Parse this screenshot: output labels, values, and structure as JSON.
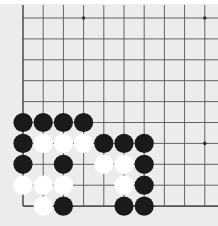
{
  "diagram": {
    "type": "go-board-corner",
    "grid": {
      "cols": 10,
      "rows": 10,
      "origin_x": 23,
      "origin_y": 18,
      "spacing_x": 20.2,
      "spacing_y": 20.9,
      "edges": [
        "left",
        "bottom"
      ]
    },
    "colors": {
      "background": "#ececec",
      "line": "#555555",
      "black_stone": "#1a1a1a",
      "white_stone": "#ffffff"
    },
    "star_points": [
      {
        "col": 3,
        "row": 0
      },
      {
        "col": 9,
        "row": 0
      },
      {
        "col": 9,
        "row": 6
      }
    ],
    "stones": [
      {
        "color": "black",
        "col": 0,
        "row": 5
      },
      {
        "color": "black",
        "col": 1,
        "row": 5
      },
      {
        "color": "black",
        "col": 2,
        "row": 5
      },
      {
        "color": "black",
        "col": 3,
        "row": 5
      },
      {
        "color": "black",
        "col": 0,
        "row": 6
      },
      {
        "color": "white",
        "col": 1,
        "row": 6
      },
      {
        "color": "white",
        "col": 2,
        "row": 6
      },
      {
        "color": "white",
        "col": 3,
        "row": 6
      },
      {
        "color": "black",
        "col": 4,
        "row": 6
      },
      {
        "color": "black",
        "col": 5,
        "row": 6
      },
      {
        "color": "black",
        "col": 6,
        "row": 6
      },
      {
        "color": "black",
        "col": 0,
        "row": 7
      },
      {
        "color": "black",
        "col": 2,
        "row": 7
      },
      {
        "color": "white",
        "col": 4,
        "row": 7
      },
      {
        "color": "white",
        "col": 5,
        "row": 7
      },
      {
        "color": "black",
        "col": 6,
        "row": 7
      },
      {
        "color": "white",
        "col": 0,
        "row": 8
      },
      {
        "color": "white",
        "col": 1,
        "row": 8
      },
      {
        "color": "white",
        "col": 2,
        "row": 8
      },
      {
        "color": "white",
        "col": 5,
        "row": 8
      },
      {
        "color": "black",
        "col": 6,
        "row": 8
      },
      {
        "color": "white",
        "col": 1,
        "row": 9
      },
      {
        "color": "black",
        "col": 2,
        "row": 9
      },
      {
        "color": "black",
        "col": 5,
        "row": 9
      },
      {
        "color": "black",
        "col": 6,
        "row": 9
      }
    ]
  }
}
